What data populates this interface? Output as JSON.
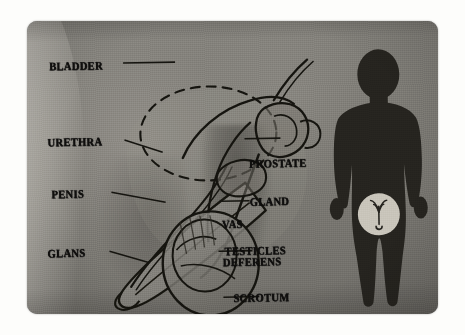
{
  "figure": {
    "kind": "anatomical-illustration",
    "media": "photographic print of an educational diagram",
    "palette": {
      "page_background": "#fdfdfb",
      "photo_background": "#82807a",
      "skin_light": "#bdbab3",
      "skin_mid": "#8a8882",
      "skin_shadow": "#6e6c67",
      "line_art": "#141312",
      "label_text": "#100f0e",
      "silhouette_fill": "#26241f",
      "highlight_circle": "#c9c5bb"
    }
  },
  "labels": {
    "left": [
      {
        "id": "bladder",
        "text": "BLADDER",
        "leader": "to dashed bladder outline"
      },
      {
        "id": "urethra",
        "text": "URETHRA",
        "leader": "to urethral canal in penis"
      },
      {
        "id": "penis",
        "text": "PENIS",
        "leader": "to penile shaft"
      },
      {
        "id": "glans",
        "text": "GLANS",
        "leader": "to tip of penis"
      }
    ],
    "right": [
      {
        "id": "prostate",
        "line1": "PROSTATE",
        "line2": "GLAND",
        "leader": "to prostate gland"
      },
      {
        "id": "vas",
        "line1": "VAS",
        "line2": "DEFERENS",
        "leader": "to vas deferens duct"
      },
      {
        "id": "testicles",
        "line1": "TESTICLES",
        "line2": "",
        "leader": "to testicle"
      },
      {
        "id": "scrotum",
        "line1": "SCROTUM",
        "line2": "",
        "leader": "to scrotal sac"
      }
    ]
  },
  "silhouette": {
    "description": "dark standing male body silhouette",
    "highlight": {
      "shape": "circle",
      "location": "groin",
      "contains": "miniature reproductive-organ glyph"
    }
  },
  "drawing_elements": {
    "bladder_outline": "dashed ellipse",
    "prostate": "solid irregular lobed outline",
    "vas_deferens": "long curved duct line",
    "urethra": "line running length of the shaft",
    "testicle": "oval within scrotum",
    "scrotum": "large rounded sac outline"
  }
}
